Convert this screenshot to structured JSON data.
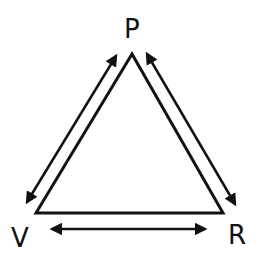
{
  "diagram": {
    "type": "triangle-relationship",
    "nodes": [
      {
        "id": "P",
        "label": "P",
        "position": "top"
      },
      {
        "id": "V",
        "label": "V",
        "position": "bottom-left"
      },
      {
        "id": "R",
        "label": "R",
        "position": "bottom-right"
      }
    ],
    "edges": [
      {
        "from": "P",
        "to": "V",
        "direction": "bidirectional"
      },
      {
        "from": "P",
        "to": "R",
        "direction": "bidirectional"
      },
      {
        "from": "V",
        "to": "R",
        "direction": "bidirectional"
      }
    ],
    "colors": {
      "stroke": "#111111",
      "background": "#ffffff"
    }
  }
}
